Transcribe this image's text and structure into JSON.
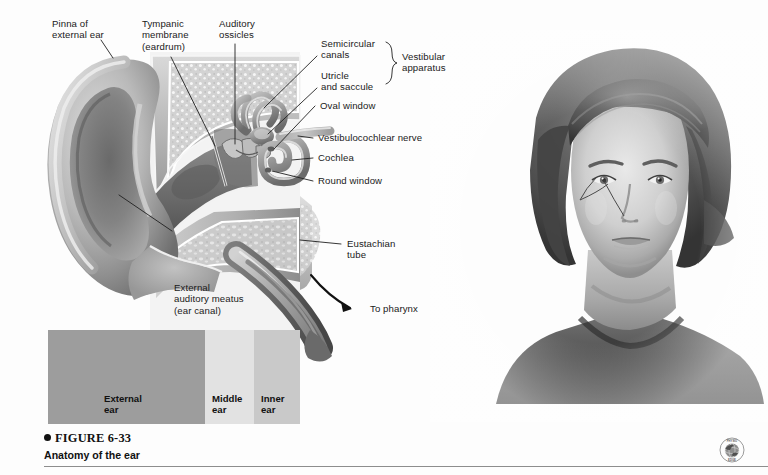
{
  "figure": {
    "bullet": "●",
    "number": "FIGURE 6-33",
    "title": "Anatomy of the ear"
  },
  "labels": {
    "pinna": "Pinna of\nexternal ear",
    "tympanic": "Tympanic\nmembrane\n(eardrum)",
    "ossicles": "Auditory\nossicles",
    "semicircular": "Semicircular\ncanals",
    "utricle": "Utricle\nand saccule",
    "vestibular_apparatus": "Vestibular\napparatus",
    "oval_window": "Oval window",
    "vestibulocochlear": "Vestibulocochlear nerve",
    "cochlea": "Cochlea",
    "round_window": "Round window",
    "eustachian": "Eustachian\ntube",
    "to_pharynx": "To pharynx",
    "meatus": "External\nauditory meatus\n(ear canal)"
  },
  "bands": [
    {
      "name": "external-ear",
      "label": "External\near",
      "color": "#9d9d9d",
      "left": 0,
      "width": 157
    },
    {
      "name": "middle-ear",
      "label": "Middle\near",
      "color": "#e2e2e2",
      "left": 157,
      "width": 49
    },
    {
      "name": "inner-ear",
      "label": "Inner\near",
      "color": "#c9c9c9",
      "left": 206,
      "width": 46
    }
  ],
  "logo": {
    "name": "physioedge-globe-logo",
    "top_text": "PHYSIO",
    "bottom_text": "EDGE"
  },
  "colors": {
    "page_background": "#fdfdfd",
    "label_text": "#1a1a1a",
    "leader_line": "#202020",
    "rule": "#8d8d8d",
    "cartilage_light": "#c8c8c8",
    "cartilage_mid": "#a0a0a0",
    "cartilage_dark": "#6f6f6f",
    "bone_light": "#d8d8d8",
    "canal_dark": "#4a4a4a",
    "skin_light": "#dcdcdc",
    "hair_dark": "#4b4b4b"
  },
  "illustrations": {
    "ear_cross_section": "grayscale-airbrush-cross-section-of-human-ear",
    "portrait": "grayscale-airbrush-portrait-of-woman-front-view-with-ear-callout"
  }
}
